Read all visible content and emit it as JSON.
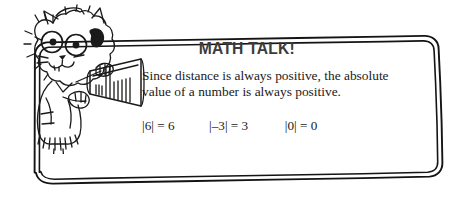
{
  "callout": {
    "title": "MATH TALK!",
    "body": "Since distance is always positive, the absolute value of a number is always positive.",
    "equations": [
      "|6| = 6",
      "|–3| = 3",
      "|0| = 0"
    ],
    "title_color": "#3c3c3c",
    "body_color": "#1a1a1a",
    "border_color": "#111111",
    "background_color": "#ffffff"
  },
  "illustration": {
    "character": "cartoon-cat-with-megaphone",
    "ink_color": "#1a1a1a"
  }
}
